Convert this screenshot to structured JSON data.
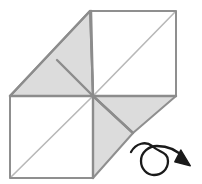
{
  "figure": {
    "canvas": {
      "width": 202,
      "height": 184,
      "background": "#ffffff"
    },
    "colors": {
      "shaded_fill": "#dcdcdc",
      "white_fill": "#ffffff",
      "outline_stroke": "#8c8c8c",
      "crease_stroke": "#b4b4b4",
      "fold_stroke": "#909090",
      "arrow_stroke": "#1a1a1a"
    },
    "geometry": {
      "center": {
        "x": 93,
        "y": 96
      },
      "top_left": {
        "x": 90,
        "y": 11
      },
      "top_right": {
        "x": 176,
        "y": 11
      },
      "mid_right": {
        "x": 176,
        "y": 96
      },
      "mid_left": {
        "x": 10,
        "y": 96
      },
      "bottom_left": {
        "x": 10,
        "y": 178
      },
      "bottom_right": {
        "x": 93,
        "y": 178
      },
      "left_peak": {
        "x": 10,
        "y": 96
      },
      "crease_vertex": {
        "x": 57,
        "y": 60
      },
      "right_flap_vertex": {
        "x": 133,
        "y": 133
      }
    },
    "panels": [
      {
        "name": "upper-left-shaded-triangle",
        "fill": "#dcdcdc",
        "points": "90,11 93,96 10,96"
      },
      {
        "name": "upper-right-white-square",
        "fill": "#ffffff",
        "points": "90,11 176,11 176,96 93,96"
      },
      {
        "name": "lower-left-white-square",
        "fill": "#ffffff",
        "points": "10,96 93,96 93,178 10,178"
      },
      {
        "name": "lower-right-shaded-triangle",
        "fill": "#dcdcdc",
        "points": "93,96 176,96 133,133"
      },
      {
        "name": "bottom-shaded-triangle",
        "fill": "#dcdcdc",
        "points": "93,96 133,133 93,178"
      }
    ],
    "creases": [
      {
        "name": "upper-right-diagonal",
        "x1": 93,
        "y1": 96,
        "x2": 176,
        "y2": 11
      },
      {
        "name": "lower-left-diagonal",
        "x1": 10,
        "y1": 178,
        "x2": 93,
        "y2": 96
      },
      {
        "name": "upper-left-fold",
        "x1": 10,
        "y1": 96,
        "x2": 93,
        "y2": 96
      },
      {
        "name": "vertical-fold",
        "x1": 93,
        "y1": 11,
        "x2": 93,
        "y2": 178
      },
      {
        "name": "upper-left-crease",
        "x1": 57,
        "y1": 60,
        "x2": 93,
        "y2": 96
      },
      {
        "name": "right-flap-crease",
        "x1": 133,
        "y1": 133,
        "x2": 93,
        "y2": 96
      }
    ],
    "arrow": {
      "name": "rotation-arrow",
      "description": "curved loop arrow indicating rotation",
      "loop_center": {
        "x": 155,
        "y": 160
      },
      "loop_radius": 13,
      "tip": {
        "x": 191,
        "y": 163
      }
    }
  }
}
